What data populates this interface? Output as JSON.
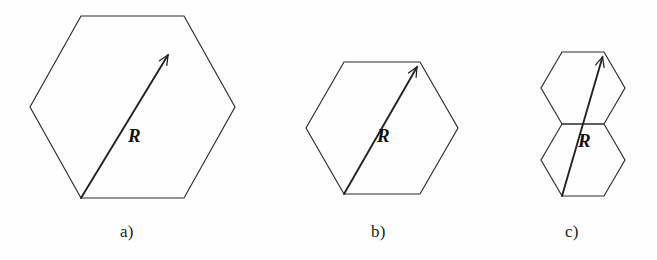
{
  "figure": {
    "type": "line-diagram",
    "background_color": "#fefefe",
    "stroke_color": "#2b2b2b",
    "panels": [
      {
        "id": "a",
        "caption": "a)",
        "vector_label": "R",
        "shape": "single-hexagon",
        "hexagon_count": 1,
        "hexagons": [
          {
            "name": "hexagon-a",
            "center_x": 132,
            "center_y": 107,
            "radius": 103,
            "orientation": "pointy-side-horizontal",
            "vertices": [
              [
                81,
                16
              ],
              [
                184,
                16
              ],
              [
                235,
                107
              ],
              [
                184,
                198
              ],
              [
                81,
                198
              ],
              [
                30,
                107
              ]
            ]
          }
        ],
        "vector": {
          "name": "vector-R-a",
          "from": [
            81,
            198
          ],
          "to": [
            168,
            55
          ],
          "label": "R",
          "label_x": 128,
          "label_y": 125
        }
      },
      {
        "id": "b",
        "caption": "b)",
        "vector_label": "R",
        "shape": "single-hexagon",
        "hexagon_count": 1,
        "hexagons": [
          {
            "name": "hexagon-b",
            "center_x": 382,
            "center_y": 128,
            "radius": 77,
            "orientation": "pointy-side-horizontal",
            "vertices": [
              [
                344,
                62
              ],
              [
                420,
                62
              ],
              [
                458,
                128
              ],
              [
                420,
                194
              ],
              [
                344,
                194
              ],
              [
                306,
                128
              ]
            ]
          }
        ],
        "vector": {
          "name": "vector-R-b",
          "from": [
            344,
            194
          ],
          "to": [
            420,
            62
          ],
          "label": "R",
          "label_x": 377,
          "label_y": 125
        }
      },
      {
        "id": "c",
        "caption": "c)",
        "vector_label": "R",
        "shape": "double-hexagon-stacked",
        "hexagon_count": 2,
        "hexagons": [
          {
            "name": "hexagon-c-top",
            "center_x": 583,
            "center_y": 88,
            "radius": 42,
            "orientation": "pointy-side-horizontal",
            "vertices": [
              [
                562,
                52
              ],
              [
                604,
                52
              ],
              [
                625,
                88
              ],
              [
                604,
                124
              ],
              [
                562,
                124
              ],
              [
                541,
                88
              ]
            ]
          },
          {
            "name": "hexagon-c-bottom",
            "center_x": 583,
            "center_y": 160,
            "radius": 42,
            "orientation": "pointy-side-horizontal",
            "vertices": [
              [
                562,
                124
              ],
              [
                604,
                124
              ],
              [
                625,
                160
              ],
              [
                604,
                196
              ],
              [
                562,
                196
              ],
              [
                541,
                160
              ]
            ]
          }
        ],
        "vector": {
          "name": "vector-R-c",
          "from": [
            562,
            196
          ],
          "to": [
            604,
            52
          ],
          "label": "R",
          "label_x": 578,
          "label_y": 130
        }
      }
    ]
  }
}
